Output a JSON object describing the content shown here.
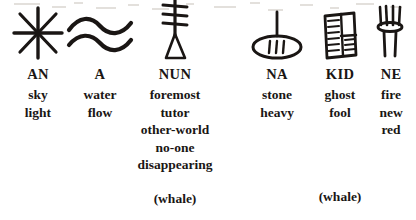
{
  "page": {
    "kind": "scanned-sign-list",
    "background_color": "#ffffff",
    "ink_color": "#1a1614",
    "columns": [
      {
        "id": "an",
        "icon_name": "cuneiform-sign-an-eight-pointed-star",
        "headword": "AN",
        "glosses": [
          "sky",
          "light"
        ],
        "trailing_note": ""
      },
      {
        "id": "a",
        "icon_name": "cuneiform-sign-a-double-wavy-water",
        "headword": "A",
        "glosses": [
          "water",
          "flow"
        ],
        "trailing_note": ""
      },
      {
        "id": "nun",
        "icon_name": "cuneiform-sign-nun-barred-post",
        "headword": "NUN",
        "glosses": [
          "foremost",
          "tutor",
          "other-world",
          "no-one",
          "disappearing"
        ],
        "trailing_note": "(whale)"
      },
      {
        "id": "na",
        "icon_name": "cuneiform-sign-na-stone-oval-on-stem",
        "headword": "NA",
        "glosses": [
          "stone",
          "heavy"
        ],
        "trailing_note": ""
      },
      {
        "id": "kid",
        "icon_name": "cuneiform-sign-kid-hatched-panel",
        "headword": "KID",
        "glosses": [
          "ghost",
          "fool"
        ],
        "trailing_note": "(whale)"
      },
      {
        "id": "ne",
        "icon_name": "cuneiform-sign-ne-flame-brazier",
        "headword": "NE",
        "glosses": [
          "fire",
          "new",
          "red"
        ],
        "trailing_note": ""
      }
    ]
  }
}
